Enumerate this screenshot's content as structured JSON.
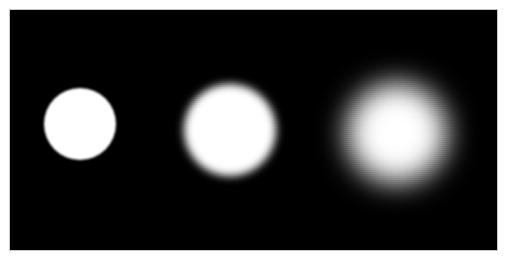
{
  "figure": {
    "canvas": {
      "width": 509,
      "height": 265,
      "background_color": "#ffffff"
    },
    "panel": {
      "x": 10,
      "y": 10,
      "width": 487,
      "height": 240,
      "background_color": "#000000",
      "border_color": "#c8c8c8"
    },
    "shape_color": "#ffffff",
    "shapes": [
      {
        "name": "disc-sharp",
        "label": "sharp",
        "center_x": 70,
        "center_y": 114,
        "radius": 36,
        "blur_px": 0.8,
        "blur_level": "none"
      },
      {
        "name": "disc-medium-blur",
        "label": "medium blur",
        "center_x": 220,
        "center_y": 120,
        "radius": 46,
        "blur_px": 4.5,
        "blur_level": "medium"
      },
      {
        "name": "disc-heavy-blur",
        "label": "heavy blur",
        "center_x": 387,
        "center_y": 123,
        "radius": 50,
        "blur_px": 14,
        "blur_level": "heavy"
      }
    ]
  }
}
